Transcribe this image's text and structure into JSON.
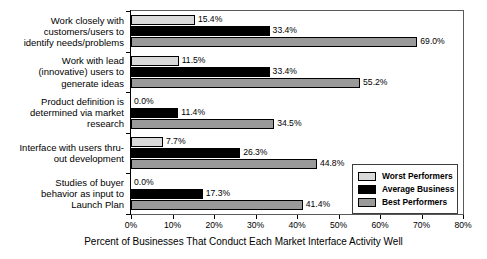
{
  "chart_data": {
    "type": "bar",
    "orientation": "horizontal",
    "title": "",
    "xlabel": "Percent of Businesses That Conduct Each Market Interface Activity Well",
    "ylabel": "",
    "xlim": [
      0,
      80
    ],
    "xtick_labels": [
      "0%",
      "10%",
      "20%",
      "30%",
      "40%",
      "50%",
      "60%",
      "70%",
      "80%"
    ],
    "xtick_values": [
      0,
      10,
      20,
      30,
      40,
      50,
      60,
      70,
      80
    ],
    "grid": false,
    "legend_position": "inside-lower-right",
    "categories": [
      "Work closely with customers/users to identify needs/problems",
      "Work with lead (innovative) users to generate ideas",
      "Product definition is determined via market research",
      "Interface with users thru-out development",
      "Studies of buyer behavior as input to Launch Plan"
    ],
    "category_lines": [
      [
        "Work closely with",
        "customers/users to",
        "identify needs/problems"
      ],
      [
        "Work with lead",
        "(innovative) users to",
        "generate ideas"
      ],
      [
        "Product definition is",
        "determined via market",
        "research"
      ],
      [
        "Interface with users thru-",
        "out development"
      ],
      [
        "Studies of buyer",
        "behavior as input to",
        "Launch Plan"
      ]
    ],
    "series": [
      {
        "name": "Worst Performers",
        "color": "#d9d9d9",
        "values": [
          15.4,
          11.5,
          0.0,
          7.7,
          0.0
        ],
        "labels": [
          "15.4%",
          "11.5%",
          "0.0%",
          "7.7%",
          "0.0%"
        ]
      },
      {
        "name": "Average Business",
        "color": "#000000",
        "values": [
          33.4,
          33.4,
          11.4,
          26.3,
          17.3
        ],
        "labels": [
          "33.4%",
          "33.4%",
          "11.4%",
          "26.3%",
          "17.3%"
        ]
      },
      {
        "name": "Best Performers",
        "color": "#9a9a9a",
        "values": [
          69.0,
          55.2,
          34.5,
          44.8,
          41.4
        ],
        "labels": [
          "69.0%",
          "55.2%",
          "34.5%",
          "44.8%",
          "41.4%"
        ]
      }
    ]
  },
  "legend": {
    "items": [
      {
        "label": "Worst Performers",
        "swatch": "worst"
      },
      {
        "label": "Average Business",
        "swatch": "avg"
      },
      {
        "label": "Best Performers",
        "swatch": "best"
      }
    ]
  }
}
